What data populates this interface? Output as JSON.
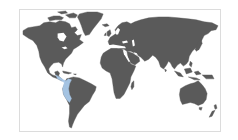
{
  "map": {
    "type": "world-choropleth",
    "projection": "miller-cropped",
    "colors": {
      "background": "#ffffff",
      "frame_border": "#dcdcdc",
      "land": "#5a5a5a",
      "highlight": "#a9c9ea"
    },
    "highlighted_regions": [
      {
        "name": "Central America / northwestern South America",
        "approx_countries": [
          "Panama",
          "Costa Rica",
          "Colombia",
          "Ecuador",
          "Peru"
        ]
      }
    ]
  }
}
